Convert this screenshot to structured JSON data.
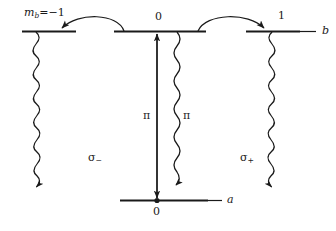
{
  "figure": {
    "type": "energy-level-diagram",
    "background_color": "#ffffff",
    "line_color": "#1a1a1a",
    "width": 336,
    "height": 231
  },
  "levels": {
    "upper": {
      "name_label": "b",
      "sublevels": [
        {
          "id": "m-minus-1",
          "label": "m",
          "label_sub": "b",
          "label_rest": "=−1",
          "m_value": -1
        },
        {
          "id": "m-zero",
          "label": "0",
          "m_value": 0
        },
        {
          "id": "m-plus-1",
          "label": "1",
          "m_value": 1
        }
      ]
    },
    "lower": {
      "name_label": "a",
      "sublevels": [
        {
          "id": "a-zero",
          "label": "0",
          "m_value": 0
        }
      ]
    }
  },
  "transitions": [
    {
      "id": "pi-pump",
      "label": "π",
      "style": "straight-double-arrow",
      "from": "a-zero",
      "to": "m-zero"
    },
    {
      "id": "pi-decay",
      "label": "π",
      "style": "wavy-arrow",
      "from": "m-zero",
      "to": "a-zero"
    },
    {
      "id": "sigma-minus-decay",
      "label": "σ",
      "label_sub": "−",
      "style": "wavy-arrow",
      "from": "m-minus-1",
      "to": "a-zero"
    },
    {
      "id": "sigma-plus-decay",
      "label": "σ",
      "label_sub": "+",
      "style": "wavy-arrow",
      "from": "m-plus-1",
      "to": "a-zero"
    },
    {
      "id": "coupling-left",
      "label": "",
      "style": "curved-arrow",
      "from": "m-zero",
      "to": "m-minus-1"
    },
    {
      "id": "coupling-right",
      "label": "",
      "style": "curved-arrow",
      "from": "m-zero",
      "to": "m-plus-1"
    }
  ],
  "labels": {
    "m_b_equals_minus_one": "m",
    "m_b_subscript": "b",
    "m_b_rest": "=−1",
    "zero_top": "0",
    "one_top": "1",
    "b_level": "b",
    "a_level": "a",
    "zero_bottom": "0",
    "pi_left": "π",
    "pi_right": "π",
    "sigma_minus": "σ",
    "sigma_minus_sub": "−",
    "sigma_plus": "σ",
    "sigma_plus_sub": "+"
  }
}
